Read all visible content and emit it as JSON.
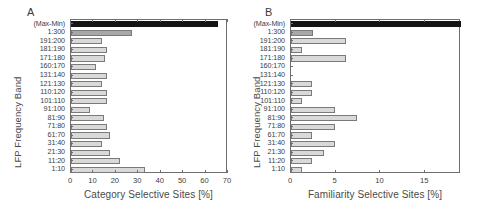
{
  "figure": {
    "panels": [
      {
        "letter": "A",
        "ylabel": "LFP Frequency Band",
        "xlabel": "Category Selective Sites [%]"
      },
      {
        "letter": "B",
        "ylabel": "LFP Frequency Band",
        "xlabel": "Familiarity Selective Sites [%]"
      }
    ]
  },
  "chart_data": [
    {
      "type": "bar",
      "orientation": "horizontal",
      "title": "A",
      "xlabel": "Category Selective Sites [%]",
      "ylabel": "LFP Frequency Band",
      "xlim": [
        0,
        70
      ],
      "xticks": [
        0,
        10,
        20,
        30,
        40,
        50,
        60,
        70
      ],
      "grid": false,
      "legend": "none",
      "categories": [
        "(Max-Min)",
        "1:300",
        "191:200",
        "181:190",
        "171:180",
        "160:170",
        "131:140",
        "121:130",
        "110:120",
        "101:110",
        "91:100",
        "81:90",
        "71:80",
        "61:70",
        "31:40",
        "21:30",
        "11:20",
        "1:10"
      ],
      "values": [
        65.5,
        27.2,
        13.6,
        15.9,
        15.0,
        11.0,
        15.9,
        13.6,
        15.9,
        15.9,
        8.5,
        14.9,
        15.9,
        17.2,
        13.7,
        17.2,
        22.0,
        33.0
      ],
      "bar_styles": [
        "dark",
        "mid",
        "light",
        "light",
        "light",
        "light",
        "light",
        "light",
        "light",
        "light",
        "light",
        "light",
        "light",
        "light",
        "light",
        "light",
        "light",
        "light"
      ]
    },
    {
      "type": "bar",
      "orientation": "horizontal",
      "title": "B",
      "xlabel": "Familiarity Selective Sites [%]",
      "ylabel": "LFP Frequency Band",
      "xlim": [
        0,
        19
      ],
      "xticks": [
        0,
        5,
        10,
        15
      ],
      "grid": false,
      "legend": "none",
      "categories": [
        "(Max-Min)",
        "1:300",
        "191:200",
        "181:190",
        "171:180",
        "160:170",
        "131:140",
        "121:130",
        "110:120",
        "101:110",
        "91:100",
        "81:90",
        "71:80",
        "61:70",
        "31:40",
        "21:30",
        "11:20",
        "1:10"
      ],
      "values": [
        19.0,
        2.5,
        6.2,
        1.2,
        6.2,
        0.0,
        0.0,
        2.4,
        2.4,
        1.2,
        4.9,
        7.4,
        4.9,
        2.4,
        4.9,
        3.7,
        2.4,
        1.2
      ],
      "bar_styles": [
        "dark",
        "mid",
        "light",
        "light",
        "light",
        "light",
        "light",
        "light",
        "light",
        "light",
        "light",
        "light",
        "light",
        "light",
        "light",
        "light",
        "light",
        "light"
      ]
    }
  ],
  "colors": {
    "bar_light": "#d9d9d9",
    "bar_mid": "#a8a8a8",
    "bar_dark": "#141414",
    "axis": "#6e6e6e",
    "text": "#3d3d3d"
  }
}
